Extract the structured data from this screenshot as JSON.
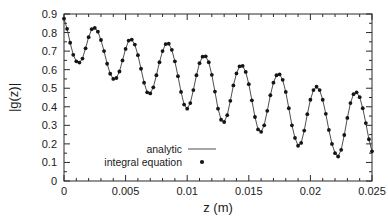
{
  "chart_data": {
    "type": "line",
    "title": "",
    "xlabel": "z (m)",
    "ylabel": "|g(z)|",
    "xlim": [
      0,
      0.025
    ],
    "ylim": [
      0,
      0.9
    ],
    "grid": false,
    "legend_position": "inside-lower-left",
    "xticks": [
      0,
      0.005,
      0.01,
      0.015,
      0.02,
      0.025
    ],
    "xticklabels": [
      "0",
      "0.005",
      "0.01",
      "0.015",
      "0.02",
      "0.025"
    ],
    "yticks": [
      0,
      0.1,
      0.2,
      0.3,
      0.4,
      0.5,
      0.6,
      0.7,
      0.8,
      0.9
    ],
    "yticklabels": [
      "0",
      "0.1",
      "0.2",
      "0.3",
      "0.4",
      "0.5",
      "0.6",
      "0.7",
      "0.8",
      "0.9"
    ],
    "x_minor_ticks_per_interval": 5,
    "y_minor_ticks_per_interval": 2,
    "series": [
      {
        "name": "analytic",
        "style": "line",
        "color": "#3a3a3a",
        "x": [
          0.0,
          0.00025,
          0.0005,
          0.00075,
          0.001,
          0.00125,
          0.0015,
          0.00175,
          0.002,
          0.00225,
          0.0025,
          0.00275,
          0.003,
          0.00325,
          0.0035,
          0.00375,
          0.004,
          0.00425,
          0.0045,
          0.00475,
          0.005,
          0.00525,
          0.0055,
          0.00575,
          0.006,
          0.00625,
          0.0065,
          0.00675,
          0.007,
          0.00725,
          0.0075,
          0.00775,
          0.008,
          0.00825,
          0.0085,
          0.00875,
          0.009,
          0.00925,
          0.0095,
          0.00975,
          0.01,
          0.01025,
          0.0105,
          0.01075,
          0.011,
          0.01125,
          0.0115,
          0.01175,
          0.012,
          0.01225,
          0.0125,
          0.01275,
          0.013,
          0.01325,
          0.0135,
          0.01375,
          0.014,
          0.01425,
          0.0145,
          0.01475,
          0.015,
          0.01525,
          0.0155,
          0.01575,
          0.016,
          0.01625,
          0.0165,
          0.01675,
          0.017,
          0.01725,
          0.0175,
          0.01775,
          0.018,
          0.01825,
          0.0185,
          0.01875,
          0.019,
          0.01925,
          0.0195,
          0.01975,
          0.02,
          0.02025,
          0.0205,
          0.02075,
          0.021,
          0.02125,
          0.0215,
          0.02175,
          0.022,
          0.02225,
          0.0225,
          0.02275,
          0.023,
          0.02325,
          0.0235,
          0.02375,
          0.024,
          0.02425,
          0.0245,
          0.02475,
          0.025
        ],
        "y": [
          0.875,
          0.82,
          0.745,
          0.68,
          0.645,
          0.638,
          0.66,
          0.715,
          0.775,
          0.818,
          0.825,
          0.805,
          0.76,
          0.7,
          0.632,
          0.578,
          0.55,
          0.555,
          0.59,
          0.65,
          0.712,
          0.757,
          0.762,
          0.735,
          0.678,
          0.605,
          0.53,
          0.478,
          0.472,
          0.505,
          0.57,
          0.64,
          0.7,
          0.738,
          0.74,
          0.707,
          0.645,
          0.565,
          0.48,
          0.412,
          0.39,
          0.42,
          0.49,
          0.57,
          0.635,
          0.67,
          0.672,
          0.64,
          0.572,
          0.482,
          0.39,
          0.33,
          0.318,
          0.355,
          0.432,
          0.515,
          0.58,
          0.618,
          0.62,
          0.588,
          0.522,
          0.435,
          0.345,
          0.278,
          0.265,
          0.3,
          0.378,
          0.462,
          0.53,
          0.57,
          0.575,
          0.545,
          0.48,
          0.392,
          0.3,
          0.232,
          0.19,
          0.205,
          0.272,
          0.36,
          0.438,
          0.49,
          0.508,
          0.49,
          0.438,
          0.362,
          0.275,
          0.2,
          0.15,
          0.132,
          0.168,
          0.248,
          0.34,
          0.42,
          0.468,
          0.478,
          0.452,
          0.392,
          0.312,
          0.225,
          0.16
        ]
      },
      {
        "name": "integral equation",
        "style": "points",
        "color": "#151515",
        "x": [
          0.0,
          0.00025,
          0.0005,
          0.00075,
          0.001,
          0.00125,
          0.0015,
          0.00175,
          0.002,
          0.00225,
          0.0025,
          0.00275,
          0.003,
          0.00325,
          0.0035,
          0.00375,
          0.004,
          0.00425,
          0.0045,
          0.00475,
          0.005,
          0.00525,
          0.0055,
          0.00575,
          0.006,
          0.00625,
          0.0065,
          0.00675,
          0.007,
          0.00725,
          0.0075,
          0.00775,
          0.008,
          0.00825,
          0.0085,
          0.00875,
          0.009,
          0.00925,
          0.0095,
          0.00975,
          0.01,
          0.01025,
          0.0105,
          0.01075,
          0.011,
          0.01125,
          0.0115,
          0.01175,
          0.012,
          0.01225,
          0.0125,
          0.01275,
          0.013,
          0.01325,
          0.0135,
          0.01375,
          0.014,
          0.01425,
          0.0145,
          0.01475,
          0.015,
          0.01525,
          0.0155,
          0.01575,
          0.016,
          0.01625,
          0.0165,
          0.01675,
          0.017,
          0.01725,
          0.0175,
          0.01775,
          0.018,
          0.01825,
          0.0185,
          0.01875,
          0.019,
          0.01925,
          0.0195,
          0.01975,
          0.02,
          0.02025,
          0.0205,
          0.02075,
          0.021,
          0.02125,
          0.0215,
          0.02175,
          0.022,
          0.02225,
          0.0225,
          0.02275,
          0.023,
          0.02325,
          0.0235,
          0.02375,
          0.024,
          0.02425,
          0.0245,
          0.02475,
          0.025
        ],
        "y": [
          0.875,
          0.82,
          0.745,
          0.68,
          0.645,
          0.638,
          0.66,
          0.715,
          0.775,
          0.818,
          0.825,
          0.805,
          0.76,
          0.7,
          0.632,
          0.578,
          0.55,
          0.555,
          0.59,
          0.65,
          0.712,
          0.757,
          0.762,
          0.735,
          0.678,
          0.605,
          0.53,
          0.478,
          0.472,
          0.505,
          0.57,
          0.64,
          0.7,
          0.738,
          0.74,
          0.707,
          0.645,
          0.565,
          0.48,
          0.412,
          0.39,
          0.42,
          0.49,
          0.57,
          0.635,
          0.67,
          0.672,
          0.64,
          0.572,
          0.482,
          0.39,
          0.33,
          0.318,
          0.355,
          0.432,
          0.515,
          0.58,
          0.618,
          0.62,
          0.588,
          0.522,
          0.435,
          0.345,
          0.278,
          0.265,
          0.3,
          0.378,
          0.462,
          0.53,
          0.57,
          0.575,
          0.545,
          0.48,
          0.392,
          0.3,
          0.232,
          0.19,
          0.205,
          0.272,
          0.36,
          0.438,
          0.49,
          0.508,
          0.49,
          0.438,
          0.362,
          0.275,
          0.2,
          0.15,
          0.132,
          0.168,
          0.248,
          0.34,
          0.42,
          0.468,
          0.478,
          0.452,
          0.392,
          0.312,
          0.225,
          0.16
        ]
      }
    ],
    "legend": [
      {
        "label": "analytic",
        "marker": "line"
      },
      {
        "label": "integral equation",
        "marker": "dot"
      }
    ]
  }
}
